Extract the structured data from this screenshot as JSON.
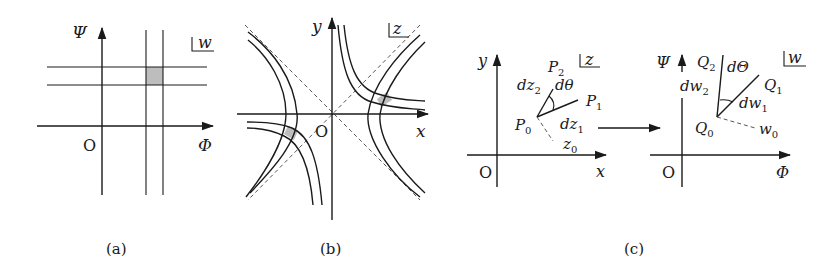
{
  "figure": {
    "panels": [
      {
        "id": "a",
        "caption": "(a)",
        "plane_label": "w",
        "x_axis_label": "Φ",
        "y_axis_label": "Ψ",
        "origin_label": "O",
        "description": "Orthogonal grid of lines Φ = const and Ψ = const in the w-plane with a shaded cell"
      },
      {
        "id": "b",
        "caption": "(b)",
        "plane_label": "z",
        "x_axis_label": "x",
        "y_axis_label": "y",
        "origin_label": "O",
        "description": "Two orthogonal families of hyperbolas in the z-plane with dashed asymptotes and shaded curvilinear cells"
      },
      {
        "id": "c_left",
        "plane_label": "z",
        "x_axis_label": "x",
        "y_axis_label": "y",
        "origin_label": "O",
        "points": {
          "p0": "P",
          "p0_sub": "0",
          "p1": "P",
          "p1_sub": "1",
          "p2": "P",
          "p2_sub": "2",
          "z0": "z",
          "z0_sub": "0"
        },
        "segments": {
          "dz1": "dz",
          "dz1_sub": "1",
          "dz2": "dz",
          "dz2_sub": "2"
        },
        "angle": "dθ"
      },
      {
        "id": "c_right",
        "caption": "(c)",
        "plane_label": "w",
        "x_axis_label": "Φ",
        "y_axis_label": "Ψ",
        "origin_label": "O",
        "points": {
          "q0": "Q",
          "q0_sub": "0",
          "q1": "Q",
          "q1_sub": "1",
          "q2": "Q",
          "q2_sub": "2",
          "w0": "w",
          "w0_sub": "0"
        },
        "segments": {
          "dw1": "dw",
          "dw1_sub": "1",
          "dw2": "dw",
          "dw2_sub": "2"
        },
        "angle": "dΘ"
      }
    ],
    "colors": {
      "ink": "#1a1a1a",
      "shade": "#bdbdbd",
      "background": "#ffffff"
    }
  }
}
